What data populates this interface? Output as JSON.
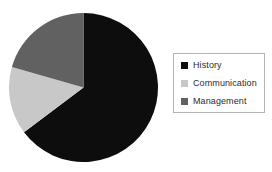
{
  "chart_data": {
    "type": "pie",
    "title": "",
    "subtitle": "",
    "xlabel": "",
    "ylabel": "",
    "grid": false,
    "legend_position": "right",
    "start_angle_deg": 0,
    "direction": "clockwise",
    "categories": [
      "History",
      "Communication",
      "Management"
    ],
    "values": [
      64.7,
      14.7,
      20.6
    ],
    "value_unit": "percent",
    "slices": [
      {
        "label": "History",
        "value": 64.7,
        "sweep_deg": 233,
        "start_deg": 0,
        "end_deg": 233,
        "color": "#0d0d0d"
      },
      {
        "label": "Communication",
        "value": 14.7,
        "sweep_deg": 53,
        "start_deg": 233,
        "end_deg": 286,
        "color": "#c8c8c8"
      },
      {
        "label": "Management",
        "value": 20.6,
        "sweep_deg": 74,
        "start_deg": 286,
        "end_deg": 360,
        "color": "#616161"
      }
    ],
    "annotations": []
  },
  "legend": {
    "items": [
      {
        "label": "History",
        "color": "#0d0d0d"
      },
      {
        "label": "Communication",
        "color": "#c8c8c8"
      },
      {
        "label": "Management",
        "color": "#616161"
      }
    ],
    "border_color": "#b4b4b4"
  },
  "colors": {
    "background": "#ffffff",
    "text": "#2b2b2b",
    "series_history": "#0d0d0d",
    "series_communication": "#c8c8c8",
    "series_management": "#616161"
  }
}
